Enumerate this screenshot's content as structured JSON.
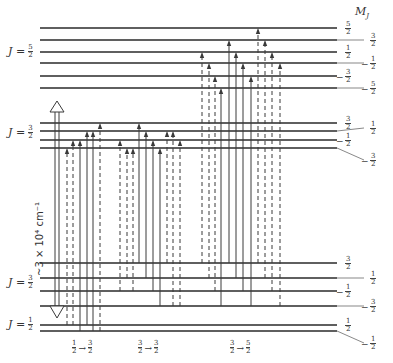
{
  "figure": {
    "mj_header": "M",
    "mj_header_sub": "J",
    "energy_gap_label": "~3 × 10⁴ cm⁻¹",
    "colors": {
      "line": "#2a2a2a",
      "arrow": "#3a3a3a",
      "background": "#ffffff"
    }
  },
  "levels": {
    "upper_J52": {
      "j_label": "J =",
      "j_num": "5",
      "j_den": "2",
      "mj": [
        {
          "sign": "",
          "num": "5",
          "den": "2",
          "y": 28
        },
        {
          "sign": "",
          "num": "3",
          "den": "2",
          "y": 40
        },
        {
          "sign": "",
          "num": "1",
          "den": "2",
          "y": 52
        },
        {
          "sign": "−",
          "num": "1",
          "den": "2",
          "y": 63
        },
        {
          "sign": "−",
          "num": "3",
          "den": "2",
          "y": 76
        },
        {
          "sign": "−",
          "num": "5",
          "den": "2",
          "y": 88
        }
      ]
    },
    "upper_J32": {
      "j_label": "J =",
      "j_num": "3",
      "j_den": "2",
      "mj": [
        {
          "sign": "",
          "num": "3",
          "den": "2",
          "y": 123
        },
        {
          "sign": "",
          "num": "1",
          "den": "2",
          "y": 131
        },
        {
          "sign": "−",
          "num": "1",
          "den": "2",
          "y": 140
        },
        {
          "sign": "−",
          "num": "3",
          "den": "2",
          "y": 148
        }
      ]
    },
    "lower_J32": {
      "j_label": "J =",
      "j_num": "3",
      "j_den": "2",
      "mj": [
        {
          "sign": "",
          "num": "3",
          "den": "2",
          "y": 263
        },
        {
          "sign": "",
          "num": "1",
          "den": "2",
          "y": 278
        },
        {
          "sign": "−",
          "num": "1",
          "den": "2",
          "y": 291
        },
        {
          "sign": "−",
          "num": "3",
          "den": "2",
          "y": 306
        }
      ]
    },
    "lower_J12": {
      "j_label": "J =",
      "j_num": "1",
      "j_den": "2",
      "mj": [
        {
          "sign": "",
          "num": "1",
          "den": "2",
          "y": 325
        },
        {
          "sign": "−",
          "num": "1",
          "den": "2",
          "y": 331
        }
      ]
    }
  },
  "transition_groups": [
    {
      "from_num": "1",
      "from_den": "2",
      "to_num": "3",
      "to_den": "2",
      "label_x": 72
    },
    {
      "from_num": "3",
      "from_den": "2",
      "to_num": "3",
      "to_den": "2",
      "label_x": 138
    },
    {
      "from_num": "3",
      "from_den": "2",
      "to_num": "5",
      "to_den": "2",
      "label_x": 230
    }
  ],
  "transitions": [
    {
      "x": 67,
      "from_y": 325,
      "to_y": 148,
      "dashed": true
    },
    {
      "x": 73,
      "from_y": 325,
      "to_y": 140,
      "dashed": true
    },
    {
      "x": 80,
      "from_y": 331,
      "to_y": 140,
      "dashed": false
    },
    {
      "x": 87,
      "from_y": 325,
      "to_y": 131,
      "dashed": false
    },
    {
      "x": 93,
      "from_y": 331,
      "to_y": 131,
      "dashed": false
    },
    {
      "x": 100,
      "from_y": 331,
      "to_y": 123,
      "dashed": true
    },
    {
      "x": 120,
      "from_y": 291,
      "to_y": 140,
      "dashed": true
    },
    {
      "x": 127,
      "from_y": 278,
      "to_y": 148,
      "dashed": true
    },
    {
      "x": 133,
      "from_y": 291,
      "to_y": 148,
      "dashed": true
    },
    {
      "x": 139,
      "from_y": 263,
      "to_y": 123,
      "dashed": false
    },
    {
      "x": 146,
      "from_y": 278,
      "to_y": 131,
      "dashed": false
    },
    {
      "x": 153,
      "from_y": 291,
      "to_y": 140,
      "dashed": false
    },
    {
      "x": 160,
      "from_y": 306,
      "to_y": 148,
      "dashed": false
    },
    {
      "x": 167,
      "from_y": 263,
      "to_y": 131,
      "dashed": true
    },
    {
      "x": 173,
      "from_y": 306,
      "to_y": 131,
      "dashed": true
    },
    {
      "x": 180,
      "from_y": 306,
      "to_y": 140,
      "dashed": true
    },
    {
      "x": 202,
      "from_y": 263,
      "to_y": 52,
      "dashed": true
    },
    {
      "x": 209,
      "from_y": 278,
      "to_y": 63,
      "dashed": true
    },
    {
      "x": 215,
      "from_y": 291,
      "to_y": 76,
      "dashed": true
    },
    {
      "x": 221,
      "from_y": 306,
      "to_y": 88,
      "dashed": false
    },
    {
      "x": 229,
      "from_y": 263,
      "to_y": 40,
      "dashed": false
    },
    {
      "x": 236,
      "from_y": 278,
      "to_y": 52,
      "dashed": false
    },
    {
      "x": 243,
      "from_y": 291,
      "to_y": 63,
      "dashed": false
    },
    {
      "x": 251,
      "from_y": 306,
      "to_y": 76,
      "dashed": false
    },
    {
      "x": 258,
      "from_y": 263,
      "to_y": 28,
      "dashed": true
    },
    {
      "x": 265,
      "from_y": 278,
      "to_y": 40,
      "dashed": true
    },
    {
      "x": 272,
      "from_y": 291,
      "to_y": 52,
      "dashed": true
    },
    {
      "x": 280,
      "from_y": 306,
      "to_y": 63,
      "dashed": true
    }
  ]
}
